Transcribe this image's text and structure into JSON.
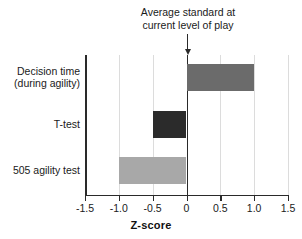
{
  "chart_data": {
    "type": "bar",
    "orientation": "horizontal",
    "title": "",
    "xlabel": "Z-score",
    "ylabel": "",
    "xlim": [
      -1.5,
      1.5
    ],
    "xticks": [
      -1.5,
      -1.0,
      -0.5,
      0,
      0.5,
      1.0,
      1.5
    ],
    "xtick_labels": [
      "-1.5",
      "-1.0",
      "-0.5",
      "0",
      "0.5",
      "1.0",
      "1.5"
    ],
    "grid": "vertical",
    "legend": "none",
    "reference_line": 0,
    "categories": [
      "Decision time\n(during agility)",
      "T-test",
      "505 agility test"
    ],
    "values": [
      1.0,
      -0.5,
      -1.0
    ],
    "bar_colors": [
      "#6b6b6b",
      "#2b2b2b",
      "#a8a8a8"
    ],
    "bars": [
      {
        "category": "Decision time\n(during agility)",
        "value": 1.0,
        "color": "#6b6b6b"
      },
      {
        "category": "T-test",
        "value": -0.5,
        "color": "#2b2b2b"
      },
      {
        "category": "505 agility test",
        "value": -1.0,
        "color": "#a8a8a8"
      }
    ],
    "annotations": [
      {
        "text": "Average standard at\ncurrent level of play",
        "points_to": 0,
        "marker": "down-arrow"
      }
    ]
  },
  "axis": {
    "x_label": "Z-score"
  },
  "annotation": {
    "text": "Average standard at\ncurrent level of play"
  }
}
